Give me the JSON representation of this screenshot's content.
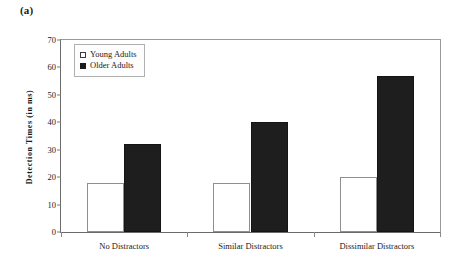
{
  "figure": {
    "panel_label": "(a)"
  },
  "legend": {
    "position": "top-left-inside",
    "items": [
      {
        "label": "Young Adults",
        "swatch": "open-square",
        "color": "#ffffff"
      },
      {
        "label": "Older Adults",
        "swatch": "filled-square",
        "color": "#1e1e1e"
      }
    ]
  },
  "chart_data": {
    "type": "bar",
    "title": "",
    "xlabel": "",
    "ylabel": "Detection Times (in ms)",
    "categories": [
      "No Distractors",
      "Similar Distractors",
      "Dissimilar Distractors"
    ],
    "series": [
      {
        "name": "Young Adults",
        "color": "#ffffff",
        "values": [
          18,
          18,
          20
        ]
      },
      {
        "name": "Older Adults",
        "color": "#1e1e1e",
        "values": [
          32,
          40,
          57
        ]
      }
    ],
    "ylim": [
      0,
      70
    ],
    "yticks": [
      0,
      10,
      20,
      30,
      40,
      50,
      60,
      70
    ],
    "ytick_labels": [
      "0",
      "10",
      "20",
      "30",
      "40",
      "50",
      "60",
      "70"
    ],
    "grid": false,
    "legend_position": "upper left"
  }
}
